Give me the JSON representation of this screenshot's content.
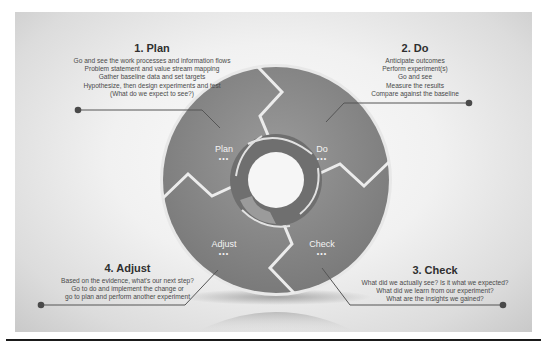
{
  "diagram": {
    "type": "cycle",
    "name": "PDCA cycle",
    "colors": {
      "frame_light": "#f4f4f4",
      "frame_dark": "#c9c9c9",
      "segment_fill": "#8c8c8c",
      "segment_dark": "#6e6e6e",
      "segment_edge": "#e6e6e6",
      "connector": "#555555",
      "rule": "#1a1a1a"
    },
    "segments": [
      {
        "label": "Plan",
        "dots": "•••"
      },
      {
        "label": "Do",
        "dots": "•••"
      },
      {
        "label": "Check",
        "dots": "•••"
      },
      {
        "label": "Adjust",
        "dots": "•••"
      }
    ],
    "steps": [
      {
        "title": "1. Plan",
        "lines": [
          "Go and see the work processes and information flows",
          "Problem statement and value stream mapping",
          "Gather baseline data and set targets",
          "Hypothesize, then design experiments and test",
          "(What do we expect to see?)"
        ]
      },
      {
        "title": "2. Do",
        "lines": [
          "Anticipate outcomes",
          "Perform experiment(s)",
          "Go and see",
          "Measure the results",
          "Compare against the baseline"
        ]
      },
      {
        "title": "3. Check",
        "lines": [
          "What did we actually see? Is it what we expected?",
          "What did we learn from our experiment?",
          "What are the insights we gained?"
        ]
      },
      {
        "title": "4. Adjust",
        "lines": [
          "Based on the evidence, what's our next step?",
          "Go to do and implement the change or",
          "go to plan and perform another experiment"
        ]
      }
    ]
  }
}
